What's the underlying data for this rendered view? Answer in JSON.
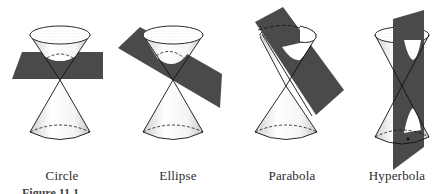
{
  "figure": {
    "caption": "Figure 11.1",
    "plane_color": "#4a4a4a",
    "line_color": "#111111",
    "panels": [
      {
        "id": "circle",
        "label": "Circle",
        "cx": 60,
        "label_x": 62
      },
      {
        "id": "ellipse",
        "label": "Ellipse",
        "cx": 173,
        "label_x": 178
      },
      {
        "id": "parabola",
        "label": "Parabola",
        "cx": 297,
        "label_x": 292
      },
      {
        "id": "hyperbola",
        "label": "Hyperbola",
        "cx": 402,
        "label_x": 397
      }
    ]
  }
}
